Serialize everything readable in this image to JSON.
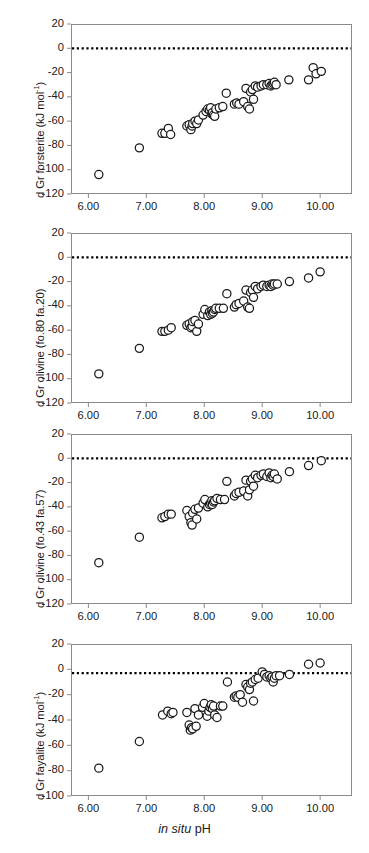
{
  "figure": {
    "xlabel_italic": "in situ",
    "xlabel_rest": " pH",
    "marker_color": "#1a1a1a",
    "frame_color": "#8a8a8a",
    "zero_line_color": "#000000"
  },
  "chart_data": [
    {
      "type": "scatter",
      "title": "",
      "xlabel": "in situ pH",
      "ylabel": "d Gr forsterite (kJ mol-1)",
      "ylabel_main": "d Gr forsterite (kJ mol",
      "ylabel_sup": "-1",
      "ylabel_tail": ")",
      "xlim": [
        5.7,
        10.55
      ],
      "ylim": [
        -120,
        20
      ],
      "xticks": [
        "6.00",
        "7.00",
        "8.00",
        "9.00",
        "10.00"
      ],
      "xtickvals": [
        6,
        7,
        8,
        9,
        10
      ],
      "yticks": [
        "20",
        "0",
        "-20",
        "-40",
        "-60",
        "-80",
        "-100",
        "-120"
      ],
      "ytickvals": [
        20,
        0,
        -20,
        -40,
        -60,
        -80,
        -100,
        -120
      ],
      "grid": false,
      "legend": "none",
      "reference_line": {
        "y": 0,
        "style": "dotted"
      },
      "points": [
        [
          6.18,
          -104
        ],
        [
          6.88,
          -82
        ],
        [
          7.27,
          -70
        ],
        [
          7.32,
          -70
        ],
        [
          7.38,
          -66
        ],
        [
          7.42,
          -71
        ],
        [
          7.7,
          -64
        ],
        [
          7.74,
          -63
        ],
        [
          7.77,
          -67
        ],
        [
          7.79,
          -64
        ],
        [
          7.8,
          -62
        ],
        [
          7.84,
          -60
        ],
        [
          7.87,
          -62
        ],
        [
          7.9,
          -59
        ],
        [
          7.98,
          -55
        ],
        [
          8.03,
          -52
        ],
        [
          8.06,
          -50
        ],
        [
          8.09,
          -51
        ],
        [
          8.11,
          -49
        ],
        [
          8.13,
          -54
        ],
        [
          8.14,
          -53
        ],
        [
          8.16,
          -55
        ],
        [
          8.18,
          -56
        ],
        [
          8.2,
          -50
        ],
        [
          8.26,
          -49
        ],
        [
          8.32,
          -48
        ],
        [
          8.38,
          -37
        ],
        [
          8.52,
          -46
        ],
        [
          8.56,
          -45
        ],
        [
          8.6,
          -46
        ],
        [
          8.68,
          -44
        ],
        [
          8.72,
          -33
        ],
        [
          8.75,
          -48
        ],
        [
          8.78,
          -50
        ],
        [
          8.8,
          -36
        ],
        [
          8.83,
          -34
        ],
        [
          8.85,
          -42
        ],
        [
          8.88,
          -31
        ],
        [
          8.92,
          -32
        ],
        [
          8.98,
          -31
        ],
        [
          9.02,
          -30
        ],
        [
          9.08,
          -30
        ],
        [
          9.12,
          -29
        ],
        [
          9.15,
          -31
        ],
        [
          9.17,
          -30
        ],
        [
          9.19,
          -29
        ],
        [
          9.21,
          -28
        ],
        [
          9.24,
          -30
        ],
        [
          9.46,
          -26
        ],
        [
          9.8,
          -26
        ],
        [
          9.88,
          -16
        ],
        [
          9.93,
          -21
        ],
        [
          10.02,
          -19
        ]
      ]
    },
    {
      "type": "scatter",
      "title": "",
      "xlabel": "in situ pH",
      "ylabel": "d Gr olivine (fo.80 fa.20)",
      "ylabel_main": "d Gr olivine (fo.80 fa.20)",
      "ylabel_sup": "",
      "ylabel_tail": "",
      "xlim": [
        5.7,
        10.55
      ],
      "ylim": [
        -120,
        20
      ],
      "xticks": [
        "6.00",
        "7.00",
        "8.00",
        "9.00",
        "10.00"
      ],
      "xtickvals": [
        6,
        7,
        8,
        9,
        10
      ],
      "yticks": [
        "20",
        "0",
        "-20",
        "-40",
        "-60",
        "-80",
        "-100",
        "-120"
      ],
      "ytickvals": [
        20,
        0,
        -20,
        -40,
        -60,
        -80,
        -100,
        -120
      ],
      "grid": false,
      "legend": "none",
      "reference_line": {
        "y": 0,
        "style": "dotted"
      },
      "points": [
        [
          6.18,
          -96
        ],
        [
          6.88,
          -75
        ],
        [
          7.27,
          -61
        ],
        [
          7.32,
          -61
        ],
        [
          7.38,
          -60
        ],
        [
          7.43,
          -58
        ],
        [
          7.7,
          -56
        ],
        [
          7.74,
          -55
        ],
        [
          7.77,
          -58
        ],
        [
          7.79,
          -57
        ],
        [
          7.8,
          -53
        ],
        [
          7.84,
          -52
        ],
        [
          7.87,
          -61
        ],
        [
          7.9,
          -55
        ],
        [
          7.98,
          -47
        ],
        [
          8.01,
          -43
        ],
        [
          8.06,
          -48
        ],
        [
          8.09,
          -45
        ],
        [
          8.11,
          -47
        ],
        [
          8.13,
          -44
        ],
        [
          8.14,
          -46
        ],
        [
          8.16,
          -45
        ],
        [
          8.18,
          -43
        ],
        [
          8.2,
          -42
        ],
        [
          8.26,
          -42
        ],
        [
          8.33,
          -42
        ],
        [
          8.39,
          -30
        ],
        [
          8.52,
          -41
        ],
        [
          8.55,
          -39
        ],
        [
          8.6,
          -38
        ],
        [
          8.68,
          -36
        ],
        [
          8.72,
          -27
        ],
        [
          8.75,
          -41
        ],
        [
          8.78,
          -42
        ],
        [
          8.8,
          -29
        ],
        [
          8.83,
          -27
        ],
        [
          8.85,
          -33
        ],
        [
          8.88,
          -24
        ],
        [
          8.92,
          -26
        ],
        [
          8.98,
          -24
        ],
        [
          9.02,
          -23
        ],
        [
          9.08,
          -24
        ],
        [
          9.12,
          -23
        ],
        [
          9.15,
          -24
        ],
        [
          9.17,
          -22
        ],
        [
          9.19,
          -23
        ],
        [
          9.21,
          -22
        ],
        [
          9.26,
          -22
        ],
        [
          9.47,
          -20
        ],
        [
          9.8,
          -17
        ],
        [
          10.0,
          -12
        ]
      ]
    },
    {
      "type": "scatter",
      "title": "",
      "xlabel": "in situ pH",
      "ylabel": "d Gr olivine (fo.43 fa.57)",
      "ylabel_main": "d Gr olivine (fo.43 fa.57)",
      "ylabel_sup": "",
      "ylabel_tail": "",
      "xlim": [
        5.7,
        10.55
      ],
      "ylim": [
        -120,
        20
      ],
      "xticks": [
        "6.00",
        "7.00",
        "8.00",
        "9.00",
        "10.00"
      ],
      "xtickvals": [
        6,
        7,
        8,
        9,
        10
      ],
      "yticks": [
        "20",
        "0",
        "-20",
        "-40",
        "-60",
        "-80",
        "-100",
        "-120"
      ],
      "ytickvals": [
        20,
        0,
        -20,
        -40,
        -60,
        -80,
        -100,
        -120
      ],
      "grid": false,
      "legend": "none",
      "reference_line": {
        "y": 0,
        "style": "dotted"
      },
      "points": [
        [
          6.18,
          -86
        ],
        [
          6.88,
          -65
        ],
        [
          7.27,
          -49
        ],
        [
          7.32,
          -48
        ],
        [
          7.38,
          -46
        ],
        [
          7.43,
          -46
        ],
        [
          7.7,
          -43
        ],
        [
          7.74,
          -48
        ],
        [
          7.77,
          -53
        ],
        [
          7.79,
          -55
        ],
        [
          7.8,
          -45
        ],
        [
          7.84,
          -42
        ],
        [
          7.87,
          -50
        ],
        [
          7.9,
          -41
        ],
        [
          7.98,
          -37
        ],
        [
          8.01,
          -34
        ],
        [
          8.06,
          -40
        ],
        [
          8.09,
          -38
        ],
        [
          8.11,
          -37
        ],
        [
          8.13,
          -35
        ],
        [
          8.14,
          -38
        ],
        [
          8.16,
          -36
        ],
        [
          8.18,
          -35
        ],
        [
          8.22,
          -33
        ],
        [
          8.28,
          -34
        ],
        [
          8.35,
          -34
        ],
        [
          8.39,
          -19
        ],
        [
          8.52,
          -31
        ],
        [
          8.55,
          -29
        ],
        [
          8.6,
          -28
        ],
        [
          8.68,
          -27
        ],
        [
          8.72,
          -18
        ],
        [
          8.75,
          -31
        ],
        [
          8.78,
          -26
        ],
        [
          8.8,
          -19
        ],
        [
          8.83,
          -17
        ],
        [
          8.85,
          -23
        ],
        [
          8.88,
          -14
        ],
        [
          8.92,
          -16
        ],
        [
          8.98,
          -14
        ],
        [
          9.02,
          -13
        ],
        [
          9.08,
          -15
        ],
        [
          9.12,
          -12
        ],
        [
          9.15,
          -16
        ],
        [
          9.17,
          -14
        ],
        [
          9.19,
          -15
        ],
        [
          9.21,
          -13
        ],
        [
          9.26,
          -17
        ],
        [
          9.47,
          -11
        ],
        [
          9.8,
          -6
        ],
        [
          10.02,
          -2
        ]
      ]
    },
    {
      "type": "scatter",
      "title": "",
      "xlabel": "in situ pH",
      "ylabel": "d Gr fayalite (kJ mol-1)",
      "ylabel_main": "d Gr fayalite (kJ mol",
      "ylabel_sup": "-1",
      "ylabel_tail": ")",
      "xlim": [
        5.7,
        10.55
      ],
      "ylim": [
        -100,
        20
      ],
      "xticks": [
        "6.00",
        "7.00",
        "8.00",
        "9.00",
        "10.00"
      ],
      "xtickvals": [
        6,
        7,
        8,
        9,
        10
      ],
      "yticks": [
        "20",
        "0",
        "-20",
        "-40",
        "-60",
        "-80",
        "-100"
      ],
      "ytickvals": [
        20,
        0,
        -20,
        -40,
        -60,
        -80,
        -100
      ],
      "grid": false,
      "legend": "none",
      "reference_line": {
        "y": -3,
        "style": "dotted"
      },
      "points": [
        [
          6.18,
          -78
        ],
        [
          6.88,
          -57
        ],
        [
          7.28,
          -36
        ],
        [
          7.37,
          -33
        ],
        [
          7.43,
          -35
        ],
        [
          7.46,
          -34
        ],
        [
          7.7,
          -34
        ],
        [
          7.74,
          -44
        ],
        [
          7.76,
          -48
        ],
        [
          7.78,
          -46
        ],
        [
          7.8,
          -47
        ],
        [
          7.84,
          -31
        ],
        [
          7.86,
          -45
        ],
        [
          7.9,
          -36
        ],
        [
          7.97,
          -30
        ],
        [
          8.0,
          -27
        ],
        [
          8.05,
          -37
        ],
        [
          8.08,
          -33
        ],
        [
          8.1,
          -30
        ],
        [
          8.12,
          -28
        ],
        [
          8.14,
          -31
        ],
        [
          8.16,
          -29
        ],
        [
          8.18,
          -36
        ],
        [
          8.22,
          -38
        ],
        [
          8.28,
          -29
        ],
        [
          8.32,
          -29
        ],
        [
          8.4,
          -10
        ],
        [
          8.52,
          -22
        ],
        [
          8.55,
          -21
        ],
        [
          8.58,
          -22
        ],
        [
          8.62,
          -20
        ],
        [
          8.66,
          -26
        ],
        [
          8.72,
          -12
        ],
        [
          8.75,
          -14
        ],
        [
          8.78,
          -16
        ],
        [
          8.8,
          -11
        ],
        [
          8.83,
          -10
        ],
        [
          8.85,
          -25
        ],
        [
          8.88,
          -8
        ],
        [
          8.93,
          -7
        ],
        [
          9.0,
          -2
        ],
        [
          9.04,
          -4
        ],
        [
          9.08,
          -6
        ],
        [
          9.12,
          -5
        ],
        [
          9.15,
          -7
        ],
        [
          9.17,
          -6
        ],
        [
          9.19,
          -10
        ],
        [
          9.21,
          -7
        ],
        [
          9.24,
          -5
        ],
        [
          9.3,
          -5
        ],
        [
          9.47,
          -4
        ],
        [
          9.8,
          4
        ],
        [
          10.0,
          5
        ]
      ]
    }
  ]
}
